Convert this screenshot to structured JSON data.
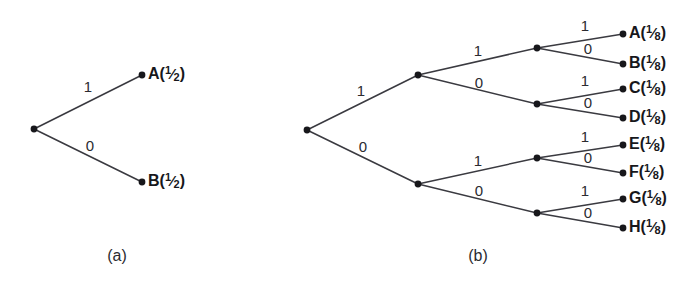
{
  "figure": {
    "background_color": "#ffffff",
    "line_color": "#3a3a40",
    "node_color": "#17171b",
    "text_color": "#17171b",
    "panels": [
      {
        "id": "panel-a",
        "caption": "(a)",
        "caption_x": 117,
        "caption_y": 257,
        "depth": 1,
        "root": {
          "x": 34,
          "y": 129
        },
        "nodes": [
          {
            "name": "root",
            "x": 34,
            "y": 129
          },
          {
            "name": "leaf-a",
            "x": 142,
            "y": 75
          },
          {
            "name": "leaf-b",
            "x": 142,
            "y": 182
          }
        ],
        "edges": [
          {
            "from": "root",
            "to": "leaf-a",
            "label": "1",
            "label_x": 88,
            "label_y": 88,
            "x1": 34,
            "y1": 129,
            "x2": 142,
            "y2": 75
          },
          {
            "from": "root",
            "to": "leaf-b",
            "label": "0",
            "label_x": 90,
            "label_y": 147,
            "x1": 34,
            "y1": 129,
            "x2": 142,
            "y2": 182
          }
        ],
        "leaves": [
          {
            "symbol": "A",
            "probability_numerator": "1",
            "probability_denominator": "2",
            "text": "A(1/2)",
            "x": 148,
            "y": 75
          },
          {
            "symbol": "B",
            "probability_numerator": "1",
            "probability_denominator": "2",
            "text": "B(1/2)",
            "x": 148,
            "y": 182
          }
        ]
      },
      {
        "id": "panel-b",
        "caption": "(b)",
        "caption_x": 478,
        "caption_y": 257,
        "depth": 3,
        "root": {
          "x": 307,
          "y": 130
        },
        "nodes": [
          {
            "name": "root",
            "x": 307,
            "y": 130
          },
          {
            "name": "n1-upper",
            "x": 418,
            "y": 75
          },
          {
            "name": "n1-lower",
            "x": 418,
            "y": 184
          },
          {
            "name": "n2-ab",
            "x": 537,
            "y": 48
          },
          {
            "name": "n2-cd",
            "x": 537,
            "y": 104
          },
          {
            "name": "n2-ef",
            "x": 537,
            "y": 158
          },
          {
            "name": "n2-gh",
            "x": 537,
            "y": 213
          },
          {
            "name": "leaf-a",
            "x": 623,
            "y": 34
          },
          {
            "name": "leaf-b",
            "x": 623,
            "y": 64
          },
          {
            "name": "leaf-c",
            "x": 623,
            "y": 89
          },
          {
            "name": "leaf-d",
            "x": 623,
            "y": 118
          },
          {
            "name": "leaf-e",
            "x": 623,
            "y": 145
          },
          {
            "name": "leaf-f",
            "x": 623,
            "y": 173
          },
          {
            "name": "leaf-g",
            "x": 623,
            "y": 199
          },
          {
            "name": "leaf-h",
            "x": 623,
            "y": 228
          }
        ],
        "edges": [
          {
            "from": "root",
            "to": "n1-upper",
            "label": "1",
            "label_x": 361,
            "label_y": 92,
            "x1": 307,
            "y1": 130,
            "x2": 418,
            "y2": 75
          },
          {
            "from": "root",
            "to": "n1-lower",
            "label": "0",
            "label_x": 363,
            "label_y": 148,
            "x1": 307,
            "y1": 130,
            "x2": 418,
            "y2": 184
          },
          {
            "from": "n1-upper",
            "to": "n2-ab",
            "label": "1",
            "label_x": 478,
            "label_y": 52,
            "x1": 418,
            "y1": 75,
            "x2": 537,
            "y2": 48
          },
          {
            "from": "n1-upper",
            "to": "n2-cd",
            "label": "0",
            "label_x": 479,
            "label_y": 84,
            "x1": 418,
            "y1": 75,
            "x2": 537,
            "y2": 104
          },
          {
            "from": "n1-lower",
            "to": "n2-ef",
            "label": "1",
            "label_x": 478,
            "label_y": 162,
            "x1": 418,
            "y1": 184,
            "x2": 537,
            "y2": 158
          },
          {
            "from": "n1-lower",
            "to": "n2-gh",
            "label": "0",
            "label_x": 479,
            "label_y": 192,
            "x1": 418,
            "y1": 184,
            "x2": 537,
            "y2": 213
          },
          {
            "from": "n2-ab",
            "to": "leaf-a",
            "label": "1",
            "label_x": 585,
            "label_y": 27,
            "x1": 537,
            "y1": 48,
            "x2": 623,
            "y2": 34
          },
          {
            "from": "n2-ab",
            "to": "leaf-b",
            "label": "0",
            "label_x": 588,
            "label_y": 50,
            "x1": 537,
            "y1": 48,
            "x2": 623,
            "y2": 64
          },
          {
            "from": "n2-cd",
            "to": "leaf-c",
            "label": "1",
            "label_x": 585,
            "label_y": 82,
            "x1": 537,
            "y1": 104,
            "x2": 623,
            "y2": 89
          },
          {
            "from": "n2-cd",
            "to": "leaf-d",
            "label": "0",
            "label_x": 588,
            "label_y": 104,
            "x1": 537,
            "y1": 104,
            "x2": 623,
            "y2": 118
          },
          {
            "from": "n2-ef",
            "to": "leaf-e",
            "label": "1",
            "label_x": 585,
            "label_y": 138,
            "x1": 537,
            "y1": 158,
            "x2": 623,
            "y2": 145
          },
          {
            "from": "n2-ef",
            "to": "leaf-f",
            "label": "0",
            "label_x": 588,
            "label_y": 159,
            "x1": 537,
            "y1": 158,
            "x2": 623,
            "y2": 173
          },
          {
            "from": "n2-gh",
            "to": "leaf-g",
            "label": "1",
            "label_x": 585,
            "label_y": 192,
            "x1": 537,
            "y1": 213,
            "x2": 623,
            "y2": 199
          },
          {
            "from": "n2-gh",
            "to": "leaf-h",
            "label": "0",
            "label_x": 588,
            "label_y": 214,
            "x1": 537,
            "y1": 213,
            "x2": 623,
            "y2": 228
          }
        ],
        "leaves": [
          {
            "symbol": "A",
            "probability_numerator": "1",
            "probability_denominator": "8",
            "text": "A(1/8)",
            "x": 629,
            "y": 34
          },
          {
            "symbol": "B",
            "probability_numerator": "1",
            "probability_denominator": "8",
            "text": "B(1/8)",
            "x": 629,
            "y": 64
          },
          {
            "symbol": "C",
            "probability_numerator": "1",
            "probability_denominator": "8",
            "text": "C(1/8)",
            "x": 629,
            "y": 89
          },
          {
            "symbol": "D",
            "probability_numerator": "1",
            "probability_denominator": "8",
            "text": "D(1/8)",
            "x": 629,
            "y": 118
          },
          {
            "symbol": "E",
            "probability_numerator": "1",
            "probability_denominator": "8",
            "text": "E(1/8)",
            "x": 629,
            "y": 145
          },
          {
            "symbol": "F",
            "probability_numerator": "1",
            "probability_denominator": "8",
            "text": "F(1/8)",
            "x": 629,
            "y": 173
          },
          {
            "symbol": "G",
            "probability_numerator": "1",
            "probability_denominator": "8",
            "text": "G(1/8)",
            "x": 629,
            "y": 199
          },
          {
            "symbol": "H",
            "probability_numerator": "1",
            "probability_denominator": "8",
            "text": "H(1/8)",
            "x": 629,
            "y": 228
          }
        ]
      }
    ]
  }
}
